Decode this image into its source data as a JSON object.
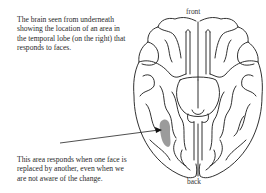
{
  "figure": {
    "description_top": "The brain seen from underneath showing the location of an area in the temporal lobe (on the right) that responds to faces.",
    "description_top_lines": [
      "The brain seen from underneath",
      "showing the location of an area in",
      "the temporal lobe (on the right) that",
      "responds to faces."
    ],
    "description_bottom_lines": [
      "This area responds when one face is",
      "replaced by another, even when we",
      "are not aware of the change."
    ],
    "orientation_labels": {
      "front": "front",
      "back": "back"
    },
    "highlight_color": "#8a8a8a",
    "outline_color": "#1a1a1a"
  }
}
